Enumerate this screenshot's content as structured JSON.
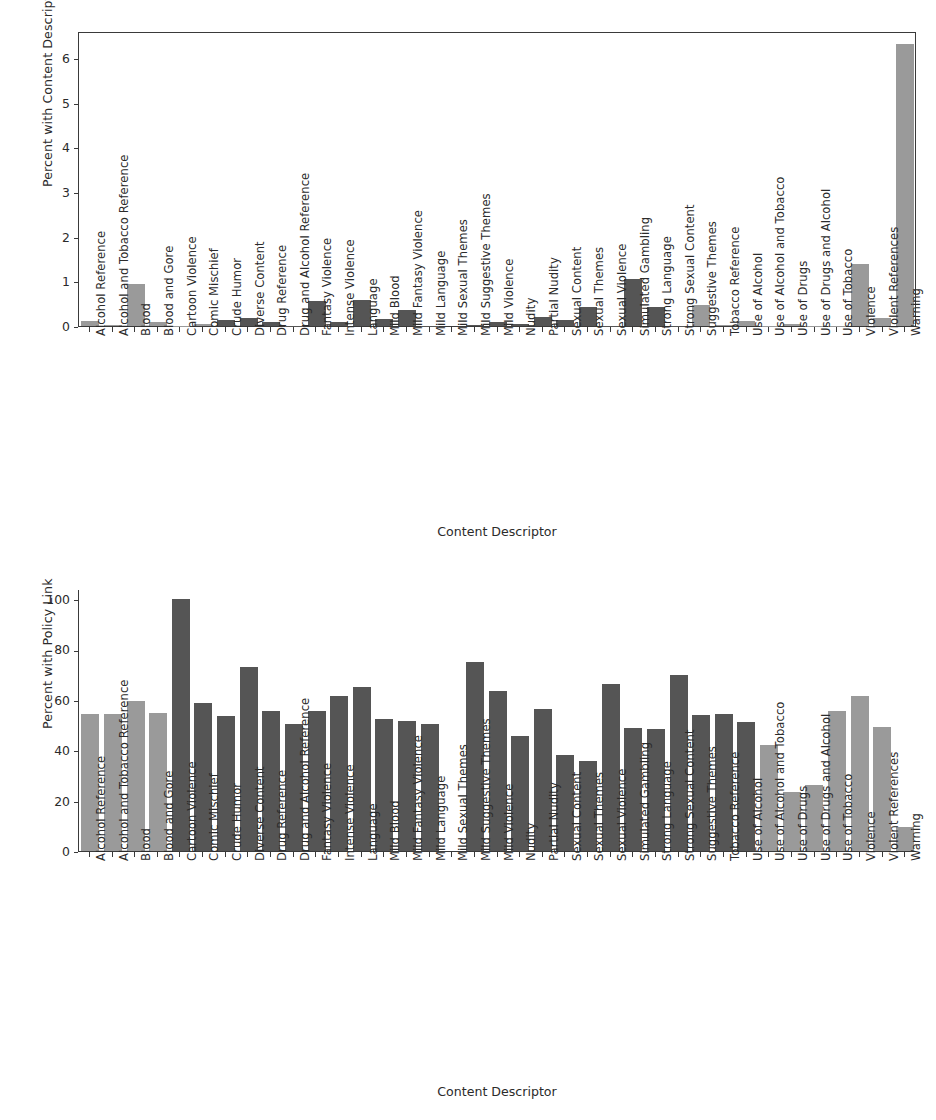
{
  "chart_data": [
    {
      "type": "bar",
      "id": "content-descriptor-percent",
      "title": "",
      "xlabel": "Content Descriptor",
      "ylabel": "Percent with Content Descriptor",
      "ylim": [
        0,
        6.6
      ],
      "yticks": [
        0,
        1,
        2,
        3,
        4,
        5,
        6
      ],
      "ytick_labels": [
        "0",
        "1",
        "2",
        "3",
        "4",
        "5",
        "6"
      ],
      "grid": false,
      "legend": "none",
      "frame": "full",
      "categories": [
        "Alcohol Reference",
        "Alcohol and Tobacco Reference",
        "Blood",
        "Blood and Gore",
        "Cartoon Violence",
        "Comic Mischief",
        "Crude Humor",
        "Diverse Content",
        "Drug Reference",
        "Drug and Alcohol Reference",
        "Fantasy Violence",
        "Intense Violence",
        "Language",
        "Mild Blood",
        "Mild Fantasy Violence",
        "Mild Language",
        "Mild Sexual Themes",
        "Mild Suggestive Themes",
        "Mild Violence",
        "Nudity",
        "Partial Nudity",
        "Sexual Content",
        "Sexual Themes",
        "Sexual Violence",
        "Simulated Gambling",
        "Strong Language",
        "Strong Sexual Content",
        "Suggestive Themes",
        "Tobacco Reference",
        "Use of Alcohol",
        "Use of Alcohol and Tobacco",
        "Use of Drugs",
        "Use of Drugs and Alcohol",
        "Use of Tobacco",
        "Violence",
        "Violent References",
        "Warning"
      ],
      "values": [
        0.12,
        0.02,
        0.93,
        0.08,
        0.01,
        0.04,
        0.13,
        0.19,
        0.09,
        0.01,
        0.57,
        0.09,
        0.59,
        0.15,
        0.35,
        0.01,
        0.0,
        0.02,
        0.08,
        0.04,
        0.2,
        0.13,
        0.43,
        0.01,
        1.06,
        0.42,
        0.01,
        0.48,
        0.02,
        0.11,
        0.01,
        0.05,
        0.01,
        0.01,
        1.39,
        0.17,
        6.3
      ],
      "colors": [
        "light",
        "light",
        "light",
        "light",
        "light",
        "light",
        "dark",
        "dark",
        "dark",
        "dark",
        "dark",
        "dark",
        "dark",
        "dark",
        "dark",
        "dark",
        "dark",
        "dark",
        "dark",
        "dark",
        "dark",
        "dark",
        "dark",
        "dark",
        "dark",
        "dark",
        "dark",
        "light",
        "light",
        "light",
        "light",
        "light",
        "light",
        "light",
        "light",
        "light",
        "light"
      ]
    },
    {
      "type": "bar",
      "id": "policy-link-percent",
      "title": "",
      "xlabel": "Content Descriptor",
      "ylabel": "Percent with Policy Link",
      "ylim": [
        0,
        104
      ],
      "yticks": [
        0,
        20,
        40,
        60,
        80,
        100
      ],
      "ytick_labels": [
        "0",
        "20",
        "40",
        "60",
        "80",
        "100"
      ],
      "grid": false,
      "legend": "none",
      "frame": "left-bottom",
      "categories": [
        "Alcohol Reference",
        "Alcohol and Tobacco Reference",
        "Blood",
        "Blood and Gore",
        "Cartoon Violence",
        "Comic Mischief",
        "Crude Humor",
        "Diverse Content",
        "Drug Reference",
        "Drug and Alcohol Reference",
        "Fantasy Violence",
        "Intense Violence",
        "Language",
        "Mild Blood",
        "Mild Fantasy Violence",
        "Mild Language",
        "Mild Sexual Themes",
        "Mild Suggestive Themes",
        "Mild Violence",
        "Nudity",
        "Partial Nudity",
        "Sexual Content",
        "Sexual Themes",
        "Sexual Violence",
        "Simulated Gambling",
        "Strong Language",
        "Strong Sexual Content",
        "Suggestive Themes",
        "Tobacco Reference",
        "Use of Alcohol",
        "Use of Alcohol and Tobacco",
        "Use of Drugs",
        "Use of Drugs and Alcohol",
        "Use of Tobacco",
        "Violence",
        "Violent References",
        "Warning"
      ],
      "values": [
        54.5,
        54.5,
        59.7,
        54.6,
        100.0,
        58.6,
        53.6,
        73.0,
        55.4,
        50.4,
        55.7,
        61.5,
        65.1,
        52.3,
        51.7,
        50.6,
        0.0,
        74.9,
        63.7,
        45.7,
        56.5,
        38.3,
        35.9,
        66.4,
        48.8,
        48.5,
        69.8,
        54.0,
        54.2,
        51.4,
        42.2,
        23.6,
        26.4,
        55.4,
        61.6,
        49.3,
        9.4
      ],
      "colors": [
        "light",
        "light",
        "light",
        "light",
        "dark",
        "dark",
        "dark",
        "dark",
        "dark",
        "dark",
        "dark",
        "dark",
        "dark",
        "dark",
        "dark",
        "dark",
        "dark",
        "dark",
        "dark",
        "dark",
        "dark",
        "dark",
        "dark",
        "dark",
        "dark",
        "dark",
        "dark",
        "dark",
        "dark",
        "dark",
        "light",
        "light",
        "light",
        "light",
        "light",
        "light",
        "light"
      ]
    }
  ],
  "style": {
    "bar_light": "#9a9a9a",
    "bar_dark": "#555555",
    "axis": "#3a3a3a",
    "text": "#2b2b2b",
    "background": "#ffffff"
  }
}
